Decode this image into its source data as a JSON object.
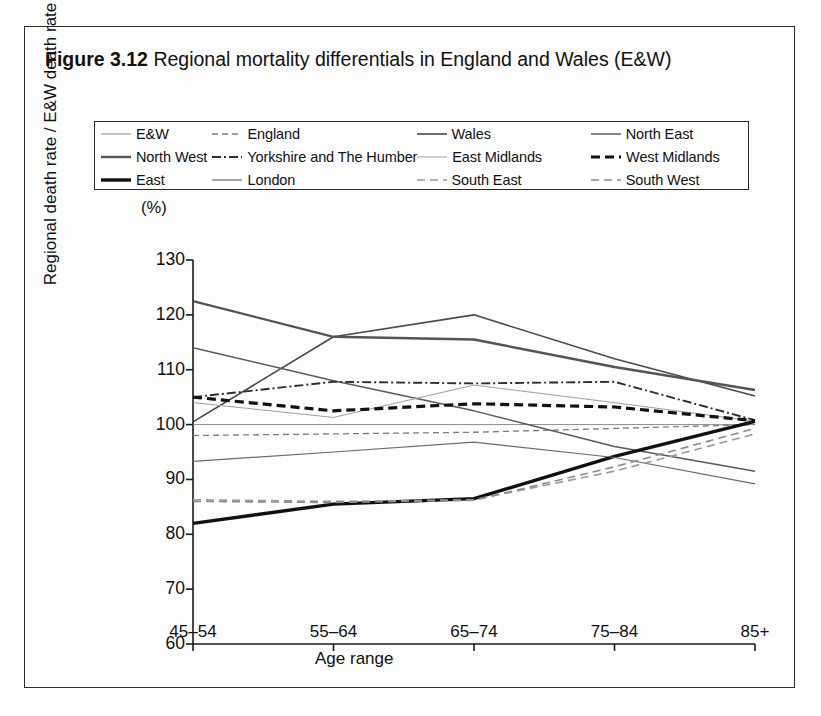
{
  "figure": {
    "number": "Figure 3.12",
    "caption": "Regional mortality differentials in England and Wales (E&W)"
  },
  "chart_data": {
    "type": "line",
    "title": "Regional mortality differentials in England and Wales (E&W)",
    "xlabel": "Age range",
    "ylabel": "Regional death rate / E&W death rate",
    "yunit": "(%)",
    "categories": [
      "45–54",
      "55–64",
      "65–74",
      "75–84",
      "85+"
    ],
    "ylim": [
      60,
      130
    ],
    "yticks": [
      60,
      70,
      80,
      90,
      100,
      110,
      120,
      130
    ],
    "grid": false,
    "legend_position": "top",
    "series": [
      {
        "name": "E&W",
        "style": "solid",
        "width": 1.0,
        "color": "#8d8d8d",
        "values": [
          100,
          100,
          100,
          100,
          100
        ]
      },
      {
        "name": "England",
        "style": "dashed",
        "width": 1.3,
        "color": "#7d7d7d",
        "values": [
          98,
          98.3,
          98.6,
          99.3,
          100
        ]
      },
      {
        "name": "Wales",
        "style": "solid",
        "width": 1.6,
        "color": "#4a4a4a",
        "values": [
          100.5,
          116,
          120,
          112,
          105.2
        ]
      },
      {
        "name": "North East",
        "style": "solid",
        "width": 1.5,
        "color": "#5a5a5a",
        "values": [
          114,
          108,
          102.5,
          96,
          91.5
        ]
      },
      {
        "name": "North West",
        "style": "solid",
        "width": 2.4,
        "color": "#545454",
        "values": [
          122.5,
          116,
          115.5,
          110.5,
          106.3
        ]
      },
      {
        "name": "Yorkshire and The Humber",
        "style": "dashdot",
        "width": 1.9,
        "color": "#2f2f2f",
        "values": [
          105,
          107.8,
          107.5,
          107.8,
          100.8
        ]
      },
      {
        "name": "East Midlands",
        "style": "solid",
        "width": 1.0,
        "color": "#a0a0a0",
        "values": [
          104,
          101.3,
          107.2,
          104,
          100.6
        ]
      },
      {
        "name": "West Midlands",
        "style": "dashed",
        "width": 3.2,
        "color": "#111111",
        "values": [
          105,
          102.5,
          103.8,
          103.2,
          100.7
        ]
      },
      {
        "name": "East",
        "style": "solid",
        "width": 3.4,
        "color": "#111111",
        "values": [
          82,
          85.5,
          86.5,
          94.2,
          100.6
        ]
      },
      {
        "name": "London",
        "style": "solid",
        "width": 1.2,
        "color": "#6b6b6b",
        "values": [
          93.3,
          95,
          96.8,
          94,
          89.2
        ]
      },
      {
        "name": "South East",
        "style": "dashed",
        "width": 1.6,
        "color": "#9a9a9a",
        "values": [
          86.3,
          86,
          86.3,
          91.5,
          98.3
        ]
      },
      {
        "name": "South West",
        "style": "dashed",
        "width": 1.6,
        "color": "#8a8a8a",
        "values": [
          86,
          85.8,
          86.2,
          92.3,
          99.3
        ]
      }
    ]
  },
  "legend": {
    "rows": [
      [
        {
          "label": "E&W",
          "series": 0
        },
        {
          "label": "England",
          "series": 1
        },
        {
          "label": "Wales",
          "series": 2
        },
        {
          "label": "North East",
          "series": 3
        }
      ],
      [
        {
          "label": "North West",
          "series": 4
        },
        {
          "label": "Yorkshire and The Humber",
          "series": 5
        },
        {
          "label": "East Midlands",
          "series": 6
        },
        {
          "label": "West Midlands",
          "series": 7
        }
      ],
      [
        {
          "label": "East",
          "series": 8
        },
        {
          "label": "London",
          "series": 9
        },
        {
          "label": "South East",
          "series": 10
        },
        {
          "label": "South West",
          "series": 11
        }
      ]
    ]
  },
  "colors": {
    "frame": "#2b2b2b",
    "axis": "#1a1a1a",
    "background": "#ffffff"
  }
}
